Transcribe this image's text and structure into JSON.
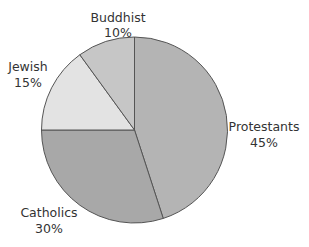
{
  "chart_data": {
    "type": "pie",
    "title": "",
    "start_angle_deg": 0,
    "direction": "clockwise",
    "categories": [
      "Protestants",
      "Catholics",
      "Jewish",
      "Buddhist"
    ],
    "values": [
      45,
      30,
      15,
      10
    ],
    "unit": "%",
    "slices": [
      {
        "label": "Protestants",
        "value": 45,
        "pct_label": "45%",
        "color": "#b4b4b4"
      },
      {
        "label": "Catholics",
        "value": 30,
        "pct_label": "30%",
        "color": "#a8a8a8"
      },
      {
        "label": "Jewish",
        "value": 15,
        "pct_label": "15%",
        "color": "#e3e3e3"
      },
      {
        "label": "Buddhist",
        "value": 10,
        "pct_label": "10%",
        "color": "#c6c6c6"
      }
    ],
    "legend": "none (labels placed next to slices)",
    "outline_color": "#555555"
  },
  "labels": {
    "protestants": {
      "name": "Protestants",
      "pct": "45%"
    },
    "catholics": {
      "name": "Catholics",
      "pct": "30%"
    },
    "jewish": {
      "name": "Jewish",
      "pct": "15%"
    },
    "buddhist": {
      "name": "Buddhist",
      "pct": "10%"
    }
  }
}
